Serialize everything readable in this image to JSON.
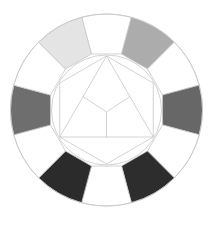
{
  "diagram": {
    "title": "",
    "type": "color-wheel-grayscale",
    "center": [
      106.5,
      110
    ],
    "outer_radius": 96,
    "inner_radius": 55,
    "stroke_color": "#c8c8c8",
    "segments": [
      {
        "position": "top",
        "angle": 0,
        "fill": "#ffffff"
      },
      {
        "position": "upper-right",
        "angle": 30,
        "fill": "#acacac"
      },
      {
        "position": "right-upper",
        "angle": 60,
        "fill": "#ffffff"
      },
      {
        "position": "right",
        "angle": 90,
        "fill": "#676767"
      },
      {
        "position": "right-lower",
        "angle": 120,
        "fill": "#ffffff"
      },
      {
        "position": "lower-right",
        "angle": 150,
        "fill": "#2d2d2d"
      },
      {
        "position": "bottom",
        "angle": 180,
        "fill": "#ffffff"
      },
      {
        "position": "lower-left",
        "angle": 210,
        "fill": "#2b2b2b"
      },
      {
        "position": "left-lower",
        "angle": 240,
        "fill": "#ffffff"
      },
      {
        "position": "left",
        "angle": 270,
        "fill": "#6e6e6e"
      },
      {
        "position": "left-upper",
        "angle": 300,
        "fill": "#ffffff"
      },
      {
        "position": "upper-left",
        "angle": 330,
        "fill": "#e4e4e4"
      }
    ],
    "inner_shapes": [
      "circle",
      "hexagon",
      "triangle",
      "y-junction"
    ]
  }
}
